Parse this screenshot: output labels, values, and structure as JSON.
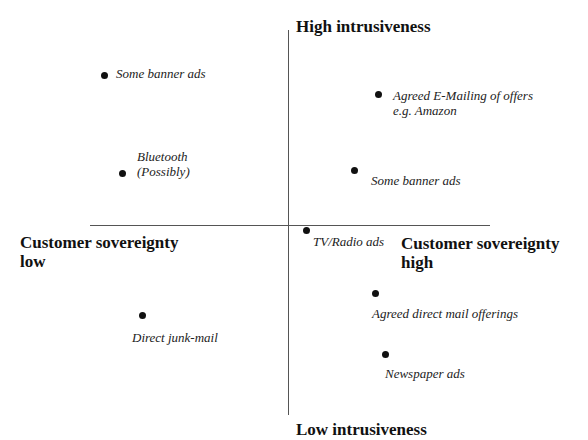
{
  "diagram": {
    "type": "quadrant",
    "axes": {
      "top": "High intrusiveness",
      "bottom": "Low intrusiveness",
      "left": "Customer sovereignty\nlow",
      "right": "Customer sovereignty\nhigh"
    },
    "items": [
      {
        "label": "Some banner ads",
        "quadrant": "high-intrusive / low-sovereignty"
      },
      {
        "label": "Bluetooth\n(Possibly)",
        "quadrant": "high-intrusive / low-sovereignty"
      },
      {
        "label": "Agreed E-Mailing of offers\ne.g. Amazon",
        "quadrant": "high-intrusive / high-sovereignty"
      },
      {
        "label": "Some banner ads",
        "quadrant": "high-intrusive / high-sovereignty"
      },
      {
        "label": "TV/Radio ads",
        "quadrant": "center"
      },
      {
        "label": "Direct junk-mail",
        "quadrant": "low-intrusive / low-sovereignty"
      },
      {
        "label": "Agreed direct mail offerings",
        "quadrant": "low-intrusive / high-sovereignty"
      },
      {
        "label": "Newspaper ads",
        "quadrant": "low-intrusive / high-sovereignty"
      }
    ]
  }
}
